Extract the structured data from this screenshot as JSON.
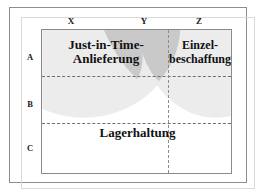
{
  "diagram": {
    "column_headers": [
      {
        "id": "x",
        "label": "X"
      },
      {
        "id": "y",
        "label": "Y"
      },
      {
        "id": "z",
        "label": "Z"
      }
    ],
    "row_headers": [
      {
        "id": "a",
        "label": "A"
      },
      {
        "id": "b",
        "label": "B"
      },
      {
        "id": "c",
        "label": "C"
      }
    ],
    "regions": [
      {
        "id": "just-in-time",
        "label_lines": [
          "Just-in-Time-",
          "Anlieferung"
        ],
        "line1": "Just-in-Time-",
        "line2": "Anlieferung",
        "covers_columns": [
          "X",
          "Y"
        ],
        "covers_rows": [
          "A"
        ]
      },
      {
        "id": "einzelbeschaffung",
        "label_lines": [
          "Einzel-",
          "beschaffung"
        ],
        "line1": "Einzel-",
        "line2": "beschaffung",
        "covers_columns": [
          "Z"
        ],
        "covers_rows": [
          "A"
        ]
      },
      {
        "id": "lagerhaltung",
        "label_lines": [
          "Lagerhaltung"
        ],
        "line1": "Lagerhaltung",
        "covers_columns": [
          "X",
          "Y",
          "Z"
        ],
        "covers_rows": [
          "C"
        ]
      }
    ],
    "colors": {
      "shade_light": "#ececec",
      "shade_dark": "#c9c9c9",
      "grid_line": "#6f6f6f",
      "box_border": "#8a8a8a",
      "frame_border": "#8e8e8e",
      "text": "#111111",
      "background": "#ffffff"
    }
  }
}
